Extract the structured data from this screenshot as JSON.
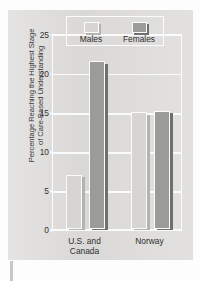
{
  "chart_data": {
    "type": "bar",
    "title": "",
    "xlabel": "",
    "ylabel": "Percentage Reaching the Highest Stage\nof Care-Based Understanding",
    "categories": [
      "U.S. and\nCanada",
      "Norway"
    ],
    "series": [
      {
        "name": "Males",
        "values": [
          7,
          15
        ]
      },
      {
        "name": "Females",
        "values": [
          21.5,
          15.2
        ]
      }
    ],
    "ylim": [
      0,
      25
    ],
    "yticks": [
      0,
      5,
      10,
      15,
      20,
      25
    ],
    "ytick_labels": [
      "0",
      "5",
      "10",
      "15",
      "20",
      "25"
    ],
    "grid": true,
    "legend_position": "top-center",
    "colors": {
      "males": "#d6d5d1",
      "females": "#9b9b98",
      "panel_background": "#dedddb",
      "gridline": "#fbfbfb",
      "text": "#2f2f2f"
    }
  },
  "legend": {
    "entries": [
      {
        "label": "Males",
        "key": "males"
      },
      {
        "label": "Females",
        "key": "females"
      }
    ]
  }
}
